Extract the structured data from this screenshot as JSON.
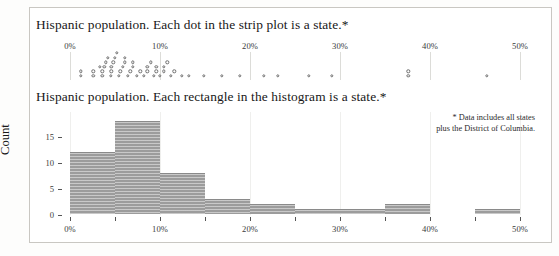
{
  "figure": {
    "background": "#ffffff",
    "frame_color": "#c9c7c2",
    "bar_color": "#9c9c9c",
    "dot_edge_color": "#6f6f6f",
    "grid_color": "#dcdcd8"
  },
  "strip": {
    "title": "Hispanic population. Each dot in the strip plot is a state.*"
  },
  "hist": {
    "title": "Hispanic population. Each rectangle in the histogram is a state.*",
    "ylabel": "Count"
  },
  "footnote": {
    "line1": "* Data includes all states",
    "line2": "plus the District of Columbia."
  },
  "chart_data": [
    {
      "type": "scatter",
      "name": "strip-plot",
      "title": "Hispanic population. Each dot in the strip plot is a state.*",
      "xlabel": "",
      "ylabel": "",
      "xlim": [
        0,
        52
      ],
      "xticks": [
        0,
        10,
        20,
        30,
        40,
        50
      ],
      "xtick_labels": [
        "0%",
        "10%",
        "20%",
        "30%",
        "40%",
        "50%"
      ],
      "grid": true,
      "legend": "none",
      "unit": "percent",
      "note": "Each dot is one US state (plus DC); dots are stacked vertically where values collide.",
      "values": [
        1.2,
        1.2,
        2.6,
        2.6,
        3.3,
        3.6,
        3.6,
        3.8,
        4.0,
        4.2,
        4.5,
        4.6,
        4.6,
        4.8,
        5.0,
        5.2,
        5.4,
        5.6,
        5.9,
        6.1,
        6.1,
        6.4,
        6.7,
        7.0,
        7.0,
        7.4,
        7.8,
        8.2,
        8.6,
        8.6,
        9.0,
        9.3,
        9.6,
        9.6,
        10.0,
        10.4,
        10.4,
        10.8,
        11.2,
        11.6,
        12.4,
        13.2,
        14.9,
        16.9,
        18.9,
        21.5,
        23.1,
        26.5,
        29.1,
        37.6,
        37.6,
        46.3
      ]
    },
    {
      "type": "bar",
      "name": "histogram",
      "title": "Hispanic population. Each rectangle in the histogram is a state.*",
      "xlabel": "",
      "ylabel": "Count",
      "xlim": [
        0,
        52
      ],
      "ylim": [
        0,
        19
      ],
      "yticks": [
        0,
        5,
        10,
        15
      ],
      "ytick_labels": [
        "0",
        "5",
        "10",
        "15"
      ],
      "xticks": [
        0,
        5,
        10,
        15,
        20,
        25,
        30,
        35,
        40,
        45,
        50
      ],
      "xtick_labels": [
        "0%",
        "",
        "10%",
        "",
        "20%",
        "",
        "30%",
        "",
        "40%",
        "",
        "50%"
      ],
      "bin_width": 5,
      "grid": true,
      "legend": "none",
      "bins": [
        {
          "start": 0,
          "end": 5,
          "count": 12
        },
        {
          "start": 5,
          "end": 10,
          "count": 18
        },
        {
          "start": 10,
          "end": 15,
          "count": 8
        },
        {
          "start": 15,
          "end": 20,
          "count": 3
        },
        {
          "start": 20,
          "end": 25,
          "count": 2
        },
        {
          "start": 25,
          "end": 30,
          "count": 1
        },
        {
          "start": 30,
          "end": 35,
          "count": 1
        },
        {
          "start": 35,
          "end": 40,
          "count": 2
        },
        {
          "start": 40,
          "end": 45,
          "count": 0
        },
        {
          "start": 45,
          "end": 50,
          "count": 1
        }
      ]
    }
  ]
}
